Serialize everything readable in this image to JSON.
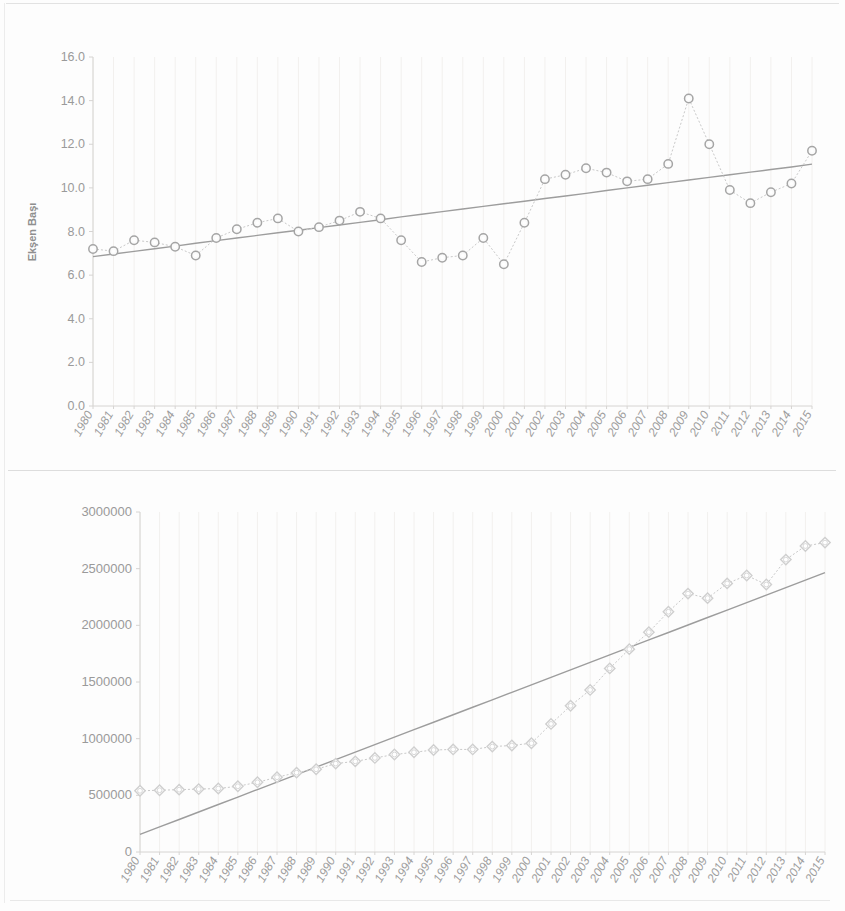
{
  "charts": [
    {
      "id": "chart-top",
      "name": "yield-per-unit-chart",
      "chart_kind": "line-with-trendline",
      "y_axis_title": "Ekşen Başı",
      "y_ticks": [
        "0.0",
        "2.0",
        "4.0",
        "6.0",
        "8.0",
        "10.0",
        "12.0",
        "14.0",
        "16.0"
      ]
    },
    {
      "id": "chart-bottom",
      "name": "production-total-chart",
      "chart_kind": "line-with-trendline",
      "y_axis_title": "",
      "y_ticks": [
        "0",
        "500000",
        "1000000",
        "1500000",
        "2000000",
        "2500000",
        "3000000"
      ]
    }
  ],
  "x_labels": [
    "1980",
    "1981",
    "1982",
    "1983",
    "1984",
    "1985",
    "1986",
    "1987",
    "1988",
    "1989",
    "1990",
    "1991",
    "1992",
    "1993",
    "1994",
    "1995",
    "1996",
    "1997",
    "1998",
    "1999",
    "2000",
    "2001",
    "2002",
    "2003",
    "2004",
    "2005",
    "2006",
    "2007",
    "2008",
    "2009",
    "2010",
    "2011",
    "2012",
    "2013",
    "2014",
    "2015"
  ],
  "colors": {
    "marker_stroke": "#a5a5a5",
    "marker_fill": "#fbfbfb",
    "series_line": "#c9c9c9",
    "trend_line": "#9d9d9d",
    "gridline": "#f2f0ee",
    "axis": "#d6d4d2",
    "tick_text": "#9a9a9a",
    "background": "#fdfdfd"
  },
  "chart_data": [
    {
      "type": "line",
      "title": "",
      "subtitle": "",
      "xlabel": "",
      "ylabel": "Ekşen Başı",
      "ylim": [
        0.0,
        16.0
      ],
      "ytick_step": 2.0,
      "grid": true,
      "legend": "none",
      "x": [
        "1980",
        "1981",
        "1982",
        "1983",
        "1984",
        "1985",
        "1986",
        "1987",
        "1988",
        "1989",
        "1990",
        "1991",
        "1992",
        "1993",
        "1994",
        "1995",
        "1996",
        "1997",
        "1998",
        "1999",
        "2000",
        "2001",
        "2002",
        "2003",
        "2004",
        "2005",
        "2006",
        "2007",
        "2008",
        "2009",
        "2010",
        "2011",
        "2012",
        "2013",
        "2014",
        "2015"
      ],
      "series": [
        {
          "name": "Ekşen Başı",
          "marker": "circle-open",
          "line_style": "dotted",
          "values": [
            7.2,
            7.1,
            7.6,
            7.5,
            7.3,
            6.9,
            7.7,
            8.1,
            8.4,
            8.6,
            8.0,
            8.2,
            8.5,
            8.9,
            8.6,
            7.6,
            6.6,
            6.8,
            6.9,
            7.7,
            6.5,
            8.4,
            10.4,
            10.6,
            10.9,
            10.7,
            10.3,
            10.4,
            11.1,
            14.1,
            12.0,
            9.9,
            9.3,
            9.8,
            10.2,
            11.7
          ]
        },
        {
          "name": "Doğrusal trend",
          "marker": "none",
          "line_style": "solid",
          "values": [
            6.85,
            6.97,
            7.09,
            7.21,
            7.33,
            7.46,
            7.58,
            7.7,
            7.82,
            7.94,
            8.06,
            8.18,
            8.3,
            8.42,
            8.54,
            8.67,
            8.79,
            8.91,
            9.03,
            9.15,
            9.27,
            9.39,
            9.51,
            9.63,
            9.75,
            9.88,
            10.0,
            10.12,
            10.24,
            10.36,
            10.48,
            10.6,
            10.72,
            10.84,
            10.96,
            11.09
          ]
        }
      ]
    },
    {
      "type": "line",
      "title": "",
      "subtitle": "",
      "xlabel": "",
      "ylabel": "",
      "ylim": [
        0,
        3000000
      ],
      "ytick_step": 500000,
      "grid": true,
      "legend": "none",
      "x": [
        "1980",
        "1981",
        "1982",
        "1983",
        "1984",
        "1985",
        "1986",
        "1987",
        "1988",
        "1989",
        "1990",
        "1991",
        "1992",
        "1993",
        "1994",
        "1995",
        "1996",
        "1997",
        "1998",
        "1999",
        "2000",
        "2001",
        "2002",
        "2003",
        "2004",
        "2005",
        "2006",
        "2007",
        "2008",
        "2009",
        "2010",
        "2011",
        "2012",
        "2013",
        "2014",
        "2015"
      ],
      "series": [
        {
          "name": "Üretim",
          "marker": "diamond-open",
          "line_style": "dotted",
          "values": [
            540000,
            545000,
            550000,
            555000,
            560000,
            580000,
            615000,
            660000,
            700000,
            730000,
            780000,
            800000,
            830000,
            860000,
            880000,
            900000,
            905000,
            905000,
            930000,
            940000,
            960000,
            1130000,
            1290000,
            1430000,
            1620000,
            1790000,
            1940000,
            2120000,
            2280000,
            2240000,
            2370000,
            2440000,
            2360000,
            2580000,
            2700000,
            2730000
          ]
        },
        {
          "name": "Doğrusal trend",
          "marker": "none",
          "line_style": "solid",
          "values": [
            155000,
            221000,
            287000,
            353000,
            419000,
            485000,
            551000,
            617000,
            683000,
            749000,
            815000,
            881000,
            947000,
            1013000,
            1079000,
            1145000,
            1211000,
            1277000,
            1343000,
            1409000,
            1475000,
            1541000,
            1607000,
            1673000,
            1739000,
            1805000,
            1871000,
            1937000,
            2003000,
            2069000,
            2135000,
            2201000,
            2267000,
            2333000,
            2399000,
            2465000
          ]
        }
      ]
    }
  ]
}
